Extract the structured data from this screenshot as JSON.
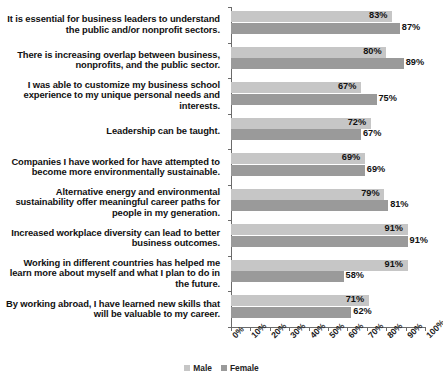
{
  "chart_data": {
    "type": "bar",
    "orientation": "horizontal",
    "title": "",
    "xlabel": "",
    "ylabel": "",
    "xlim": [
      0,
      100
    ],
    "xticks": [
      "0%",
      "10%",
      "20%",
      "30%",
      "40%",
      "50%",
      "60%",
      "70%",
      "80%",
      "90%",
      "100%"
    ],
    "grid": false,
    "legend_position": "bottom-center",
    "categories": [
      "It is essential for business leaders to understand the public and/or nonprofit sectors.",
      "There is increasing overlap between business, nonprofits, and the public sector.",
      "I was able to customize my business school experience to my unique personal needs and interests.",
      "Leadership can be taught.",
      "Companies I have worked for have attempted to become more environmentally sustainable.",
      "Alternative energy and environmental sustainability offer meaningful career paths for people in my generation.",
      "Increased workplace diversity can lead to better business outcomes.",
      "Working in different countries has helped me learn more about myself and what I plan to do in the future.",
      "By working abroad, I have learned new skills that will be valuable to my career."
    ],
    "series": [
      {
        "name": "Male",
        "color": "#c6c6c6",
        "values": [
          83,
          80,
          67,
          72,
          69,
          79,
          91,
          91,
          71
        ],
        "labels": [
          "83%",
          "80%",
          "67%",
          "72%",
          "69%",
          "79%",
          "91%",
          "91%",
          "71%"
        ]
      },
      {
        "name": "Female",
        "color": "#9a9a9a",
        "values": [
          87,
          89,
          75,
          67,
          69,
          81,
          91,
          58,
          62
        ],
        "labels": [
          "87%",
          "89%",
          "75%",
          "67%",
          "69%",
          "81%",
          "91%",
          "58%",
          "62%"
        ]
      }
    ]
  },
  "legend": {
    "items": [
      {
        "label": "Male",
        "color": "#c6c6c6"
      },
      {
        "label": "Female",
        "color": "#9a9a9a"
      }
    ]
  }
}
